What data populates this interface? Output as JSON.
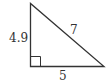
{
  "diagram": {
    "type": "right-triangle",
    "labels": {
      "vertical_leg": "4.9",
      "hypotenuse": "7",
      "horizontal_leg": "5"
    },
    "right_angle_marker": true,
    "stroke_color": "#333333"
  }
}
